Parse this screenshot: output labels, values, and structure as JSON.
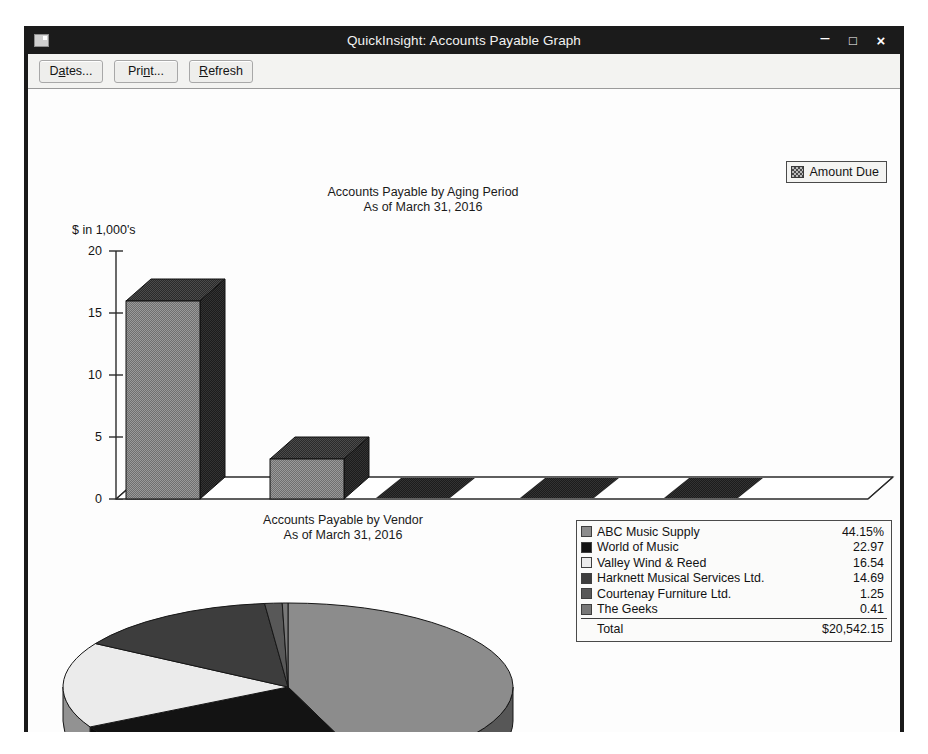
{
  "window": {
    "title": "QuickInsight: Accounts Payable Graph",
    "icon": "app-window-icon",
    "controls": {
      "minimize": "–",
      "maximize": "□",
      "close": "×"
    }
  },
  "toolbar": {
    "buttons": [
      {
        "name": "dates-button",
        "pre": "D",
        "accel": "a",
        "post": "tes..."
      },
      {
        "name": "print-button",
        "pre": "Pri",
        "accel": "n",
        "post": "t..."
      },
      {
        "name": "refresh-button",
        "pre": "",
        "accel": "R",
        "post": "efresh"
      }
    ]
  },
  "bar_chart_legend": {
    "swatch": "checker-swatch",
    "label": "Amount Due"
  },
  "pie_legend": {
    "rows": [
      {
        "label": "ABC Music Supply",
        "value": "44.15%",
        "color": "#8c8c8c"
      },
      {
        "label": "World of Music",
        "value": "22.97",
        "color": "#131313"
      },
      {
        "label": "Valley Wind & Reed",
        "value": "16.54",
        "color": "#ebebeb"
      },
      {
        "label": "Harknett Musical Services Ltd.",
        "value": "14.69",
        "color": "#3d3d3d"
      },
      {
        "label": "Courtenay Furniture Ltd.",
        "value": "1.25",
        "color": "#585858"
      },
      {
        "label": "The Geeks",
        "value": "0.41",
        "color": "#787878"
      }
    ],
    "total_label": "Total",
    "total_value": "$20,542.15"
  },
  "chart_data": [
    {
      "type": "bar",
      "name": "accounts-payable-by-aging-period",
      "title": "Accounts Payable by Aging Period",
      "subtitle": "As of March 31, 2016",
      "xlabel": "",
      "ylabel": "$ in 1,000's",
      "categories": [
        "Current",
        "1 - 30",
        "31 - 60",
        "61 - 90",
        "> 90"
      ],
      "series": [
        {
          "name": "Amount Due",
          "values": [
            16.8,
            3.2,
            0,
            0,
            0
          ]
        }
      ],
      "ylim": [
        0,
        20
      ],
      "yticks": [
        0,
        5,
        10,
        15,
        20
      ],
      "ytick_labels": [
        "0",
        "5",
        "10",
        "15",
        "20"
      ],
      "grid": false,
      "legend_position": "top-right",
      "style": "3d-columns",
      "colors": {
        "front": "#8e8e8e",
        "top": "#3a3a3a",
        "side": "#2b2b2b"
      }
    },
    {
      "type": "pie",
      "name": "accounts-payable-by-vendor",
      "title": "Accounts Payable by Vendor",
      "subtitle": "As of March 31, 2016",
      "labels": [
        "ABC Music Supply",
        "World of Music",
        "Valley Wind & Reed",
        "Harknett Musical Services Ltd.",
        "Courtenay Furniture Ltd.",
        "The Geeks"
      ],
      "values": [
        44.15,
        22.97,
        16.54,
        14.69,
        1.25,
        0.41
      ],
      "unit": "percent",
      "total": "$20,542.15",
      "colors": [
        "#8c8c8c",
        "#131313",
        "#ebebeb",
        "#3d3d3d",
        "#585858",
        "#787878"
      ],
      "legend_position": "right",
      "style": "3d-pie"
    }
  ]
}
